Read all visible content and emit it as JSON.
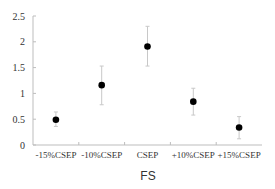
{
  "chart_data": {
    "type": "scatter",
    "title": "",
    "xlabel": "FS",
    "ylabel": "",
    "categories": [
      "-15%CSEP",
      "-10%CSEP",
      "CSEP",
      "+10%CSEP",
      "+15%CSEP"
    ],
    "values": [
      0.49,
      1.16,
      1.91,
      0.84,
      0.34
    ],
    "error_low": [
      0.36,
      0.78,
      1.53,
      0.58,
      0.12
    ],
    "error_high": [
      0.64,
      1.53,
      2.3,
      1.1,
      0.55
    ],
    "ylim": [
      0,
      2.5
    ],
    "yticks": [
      "0",
      "0.5",
      "1",
      "1.5",
      "2",
      "2.5"
    ],
    "ytick_values": [
      0,
      0.5,
      1,
      1.5,
      2,
      2.5
    ],
    "grid": false,
    "legend": null,
    "marker_color": "#000000",
    "errorbar_color": "#c8c8c8",
    "axis_color": "#bdbdbd"
  }
}
